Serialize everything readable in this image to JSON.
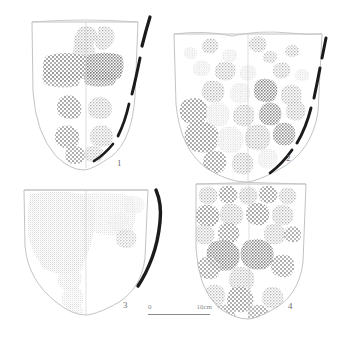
{
  "plate": {
    "background_color": "#ffffff",
    "outline_color": "#b9b9b9",
    "rim_arc_color": "#1a1a1a",
    "impression_color": "#8d8d8d",
    "label_color": "#6e6e6e",
    "width": 351,
    "height": 338
  },
  "scale_bar": {
    "zero_label": "0",
    "max_label": "10cm",
    "length_px": 62
  },
  "figures": [
    {
      "number": "1",
      "caption_label": "1",
      "position": "top-left",
      "form": "deep U-shaped vessel, rounded base",
      "decoration": "coarse woven textile impressions in vertical columns flanking a central seam",
      "has_dark_rim_arc": true,
      "dark_arc_side": "right",
      "dark_arc_style": "broken-dashed"
    },
    {
      "number": "2",
      "caption_label": "2",
      "position": "top-right",
      "form": "wide shield-shaped vessel with slightly wavy rim",
      "decoration": "dense scatter of fine basketry impression patches across body",
      "has_dark_rim_arc": true,
      "dark_arc_side": "right",
      "dark_arc_style": "broken-dashed"
    },
    {
      "number": "3",
      "caption_label": "3",
      "position": "bottom-left",
      "form": "broad shield-shaped vessel with straight rim",
      "decoration": "large continuous dense stippled impression field over left half",
      "has_dark_rim_arc": true,
      "dark_arc_side": "right",
      "dark_arc_style": "solid"
    },
    {
      "number": "4",
      "caption_label": "4",
      "position": "bottom-right",
      "form": "tall shield-shaped vessel with scalloped rim band",
      "decoration": "horizontal bands of rectangular woven impressions, symmetric about center seam",
      "has_dark_rim_arc": false,
      "dark_arc_side": "",
      "dark_arc_style": ""
    }
  ]
}
